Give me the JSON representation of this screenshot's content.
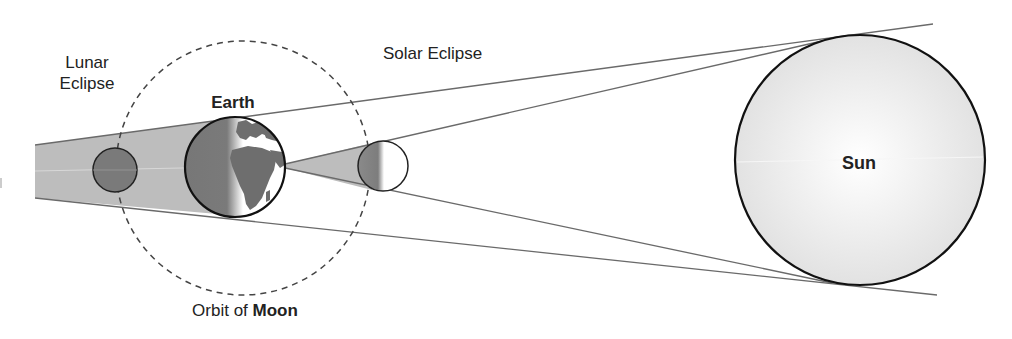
{
  "labels": {
    "lunar_line1": "Lunar",
    "lunar_line2": "Eclipse",
    "solar": "Solar Eclipse",
    "earth": "Earth",
    "orbit_prefix": "Orbit of ",
    "orbit_moon": "Moon",
    "sun": "Sun"
  },
  "colors": {
    "background": "#ffffff",
    "shadow": "#bdbdbd",
    "moon_dark": "#7a7a7a",
    "earth_land": "#6e6e6e",
    "outline": "#111111",
    "ray": "#6a6a6a",
    "sun_fill": "#ececec"
  }
}
